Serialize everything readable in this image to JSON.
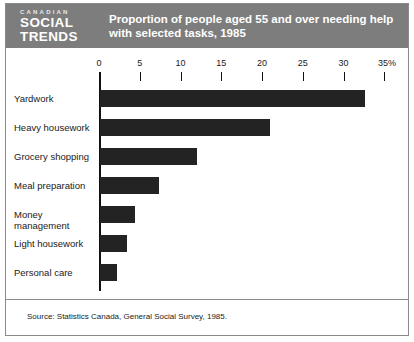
{
  "logo": {
    "line1": "CANADIAN",
    "line2": "SOCIAL",
    "line3": "TRENDS"
  },
  "header": {
    "title_line1": "Proportion of people aged 55 and over needing help",
    "title_line2": "with selected tasks, 1985",
    "band_color": "#7d7d7d"
  },
  "footer": {
    "source": "Source: Statistics Canada, General Social Survey, 1985."
  },
  "chart_data": {
    "type": "bar",
    "orientation": "horizontal",
    "title": "Proportion of people aged 55 and over needing help with selected tasks, 1985",
    "xlabel": "",
    "ylabel": "",
    "xlim": [
      0,
      35
    ],
    "grid": false,
    "legend": null,
    "bar_color": "#232323",
    "axis_unit": "%",
    "tick_labels": [
      "0",
      "5",
      "10",
      "15",
      "20",
      "25",
      "30",
      "35%"
    ],
    "ticks": [
      0,
      5,
      10,
      15,
      20,
      25,
      30,
      35
    ],
    "categories": [
      "Yardwork",
      "Heavy housework",
      "Grocery shopping",
      "Meal preparation",
      "Money management",
      "Light housework",
      "Personal care"
    ],
    "values": [
      32.5,
      20.8,
      11.9,
      7.2,
      4.3,
      3.3,
      2.1
    ]
  }
}
